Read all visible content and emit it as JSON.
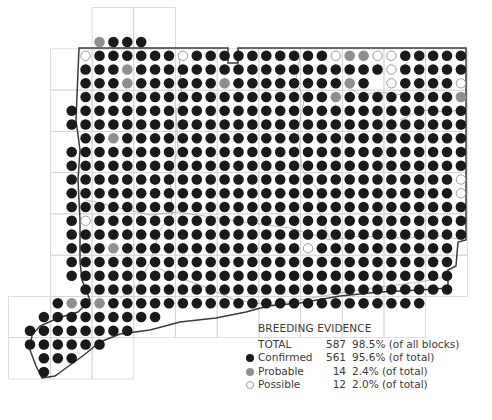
{
  "map": {
    "grid_origin_x": 30,
    "grid_origin_y": 42,
    "pitch_x": 13.9,
    "pitch_y": 13.75,
    "dot_radius": 5.3,
    "colors": {
      "confirmed": "#1a1a1a",
      "probable": "#8f8f8f",
      "possible_stroke": "#9a9a9a",
      "grid": "#d4d4d4",
      "boundary": "#3a3a3a",
      "county": "#a8a8a8"
    },
    "rows": [
      ".....PCCC.......................",
      "....OCCCCCCOCCCCCCCCCCOPPOOCCCCC",
      "....CCCPCCCCCCCCCCCCCCCCCCOCCCCC",
      "....CCCPCCCCCCPCCCCCCCCPC.OCCCCO",
      "....CCCCCCCCCCCCCCCCCCPCCCCCCCCP",
      "...CCCCCCCCCCCCCCCCCCCCCCCCCCCCC",
      "...CCCCCCCCCCCCCCCCCCCCCCCCCCCCC",
      "....CCPCCCCCCCCCCCCCCCCCCCCCCCCC",
      "...CCCCCCCCCCCCCCCCCCCCCCCCCCCCC",
      "...CCCCCCCCCCCCCCCCCCCCCCCCCCCCC",
      "...CCCCCCCCCCCCCCCCCCCCCCCCCCCCO",
      "...CCCCCCCCCCCCCCCCCCCCCCCCCCCCO",
      "...CCCCCCCCCCCCCCCCCCCCCCCCCCCCC",
      "...COCCCCCCCCCCCCCCCCCCCCCCCCCCC",
      "...CCCCCCCCCCCCCCCCCCCCCCCCCCCCC",
      "...CCCPCCCCCCCCCCCCCOCCCCCCCCCC.",
      "...CCCCCCCCCCCCCCCCCCCCCCCCCCCC.",
      "...CCCCCCCCCCCCCCCCCCCCCCCCCCCC.",
      "....CCCCCCCCCCCCCCCCCCCCCCCCCCC.",
      "..CPCPCCCCCCCCCCCCCCCCCCCCCCC...",
      ".CCCCCCCCC......................",
      "CCCCCCCC........................",
      "CCCCCC..........................",
      ".CCC............................",
      ".C.............................."
    ]
  },
  "legend": {
    "title": "BREEDING EVIDENCE",
    "rows": [
      {
        "symbol": "none",
        "label": "TOTAL",
        "count": "587",
        "pct": "98.5% (of all blocks)"
      },
      {
        "symbol": "confirmed",
        "label": "Confirmed",
        "count": "561",
        "pct": "95.6% (of total)"
      },
      {
        "symbol": "probable",
        "label": "Probable",
        "count": "14",
        "pct": "2.4% (of total)"
      },
      {
        "symbol": "possible",
        "label": "Possible",
        "count": "12",
        "pct": "2.0% (of total)"
      }
    ]
  }
}
